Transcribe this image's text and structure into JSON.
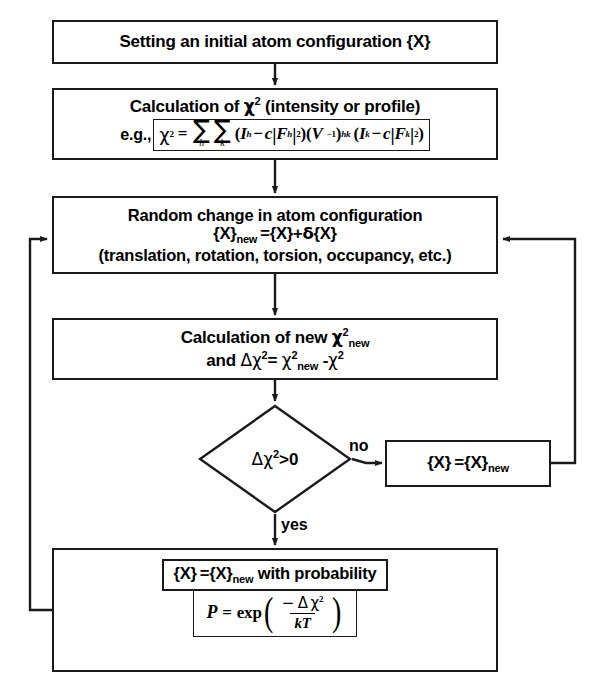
{
  "diagram": {
    "nodes": {
      "initial": {
        "text": "Setting an initial atom configuration {X}"
      },
      "chi2": {
        "title_prefix": "Calculation of ",
        "title_chi": "χ",
        "title_sup": "2",
        "title_suffix": " (intensity or profile)",
        "eg_label": "e.g.,",
        "formula": "χ² = ∑h ∑k (I_h − c|F_h|²)(V⁻¹)_hk (I_k − c|F_k|²)"
      },
      "random": {
        "line1": "Random change in atom configuration",
        "line2": "{X}new ={X}+δ{X}",
        "line3": "(translation, rotation, torsion, occupancy, etc.)"
      },
      "newchi2": {
        "line1_prefix": "Calculation of new ",
        "line1_chi": "χ",
        "line1_sup": "2",
        "line1_sub": "new",
        "line2": "and Δχ²= χ²new -χ²"
      },
      "decision": {
        "label": "Δχ²>0"
      },
      "accept": {
        "text": "{X} ={X}new"
      },
      "probability": {
        "inner_text": "{X} ={X}new with probability",
        "formula": "P = exp( −Δχ² / kT )",
        "formula_p": "P",
        "formula_eq": "=",
        "formula_exp": "exp",
        "formula_numerator": "− Δ χ",
        "formula_numerator_sup": "2",
        "formula_denominator": "kT"
      }
    },
    "edges": {
      "no_label": "no",
      "yes_label": "yes"
    },
    "symbols": {
      "chi": "χ",
      "delta_cap": "Δ",
      "delta_low": "δ",
      "sigma": "∑",
      "minus": "−",
      "sub_new": "new",
      "sub_h": "h",
      "sub_k": "k",
      "sub_hk": "hk",
      "I": "I",
      "F": "F",
      "V": "V",
      "c": "c",
      "exp_minus_one": "−1",
      "two": "2",
      "kT": "kT",
      "P": "P",
      "equals": "=",
      "paren_open": "(",
      "paren_close": ")",
      "brace_open": "{",
      "brace_close": "}",
      "X": "X"
    },
    "colors": {
      "stroke": "#1a1a1a",
      "background": "#ffffff",
      "text": "#000000"
    }
  }
}
